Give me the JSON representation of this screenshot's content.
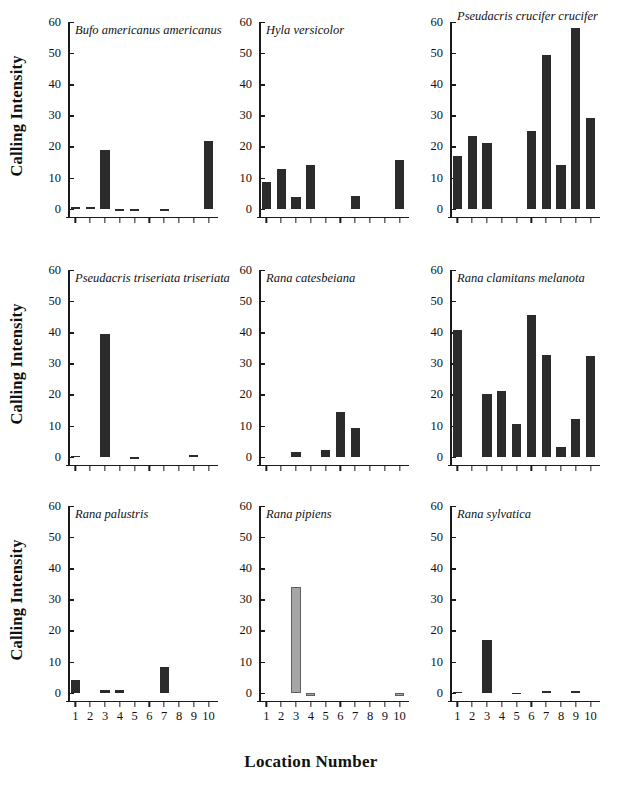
{
  "axes": {
    "ylabel": "Calling Intensity",
    "xlabel": "Location Number",
    "yticks": [
      0,
      10,
      20,
      30,
      40,
      50,
      60
    ],
    "ylim": [
      -3,
      60
    ],
    "xticks": [
      1,
      2,
      3,
      4,
      5,
      6,
      7,
      8,
      9,
      10
    ]
  },
  "colors": {
    "bar_dark": "#2b2b2b",
    "bar_light": "#a6a6a6",
    "axis": "#1a1a1a",
    "background": "#ffffff"
  },
  "chart_data": {
    "type": "bar",
    "title": "",
    "xlabel": "Location Number",
    "ylabel": "Calling Intensity",
    "ylim": [
      -3,
      60
    ],
    "yticks": [
      0,
      10,
      20,
      30,
      40,
      50,
      60
    ],
    "grid": false,
    "legend": "none",
    "categories": [
      1,
      2,
      3,
      4,
      5,
      6,
      7,
      8,
      9,
      10
    ],
    "panel_layout": {
      "rows": 3,
      "cols": 3
    },
    "panels": [
      {
        "label": "Bufo americanus americanus",
        "row": 0,
        "col": 0,
        "color": "#2b2b2b",
        "values": [
          0.6,
          0.6,
          19.0,
          -0.6,
          -0.6,
          0,
          -0.6,
          0,
          0,
          21.8
        ]
      },
      {
        "label": "Hyla versicolor",
        "row": 0,
        "col": 1,
        "color": "#2b2b2b",
        "values": [
          8.5,
          12.8,
          3.7,
          14.0,
          0,
          0,
          4.2,
          0,
          0,
          15.7
        ]
      },
      {
        "label": "Pseudacris crucifer crucifer",
        "row": 0,
        "col": 2,
        "color": "#2b2b2b",
        "values": [
          17.0,
          23.4,
          21.0,
          0,
          0,
          25.0,
          49.5,
          14.0,
          58.0,
          29.0
        ]
      },
      {
        "label": "Pseudacris triseriata triseriata",
        "row": 1,
        "col": 0,
        "color": "#2b2b2b",
        "values": [
          0.3,
          0,
          39.5,
          0,
          -0.7,
          0,
          0,
          0,
          0.4,
          0
        ]
      },
      {
        "label": "Rana catesbeiana",
        "row": 1,
        "col": 1,
        "color": "#2b2b2b",
        "values": [
          0,
          0,
          1.6,
          0,
          2.3,
          14.3,
          9.3,
          0,
          0,
          0
        ]
      },
      {
        "label": "Rana clamitans melanota",
        "row": 1,
        "col": 2,
        "color": "#2b2b2b",
        "values": [
          40.7,
          0,
          20.0,
          21.0,
          10.4,
          45.5,
          32.7,
          3.0,
          12.2,
          32.4
        ]
      },
      {
        "label": "Rana palustris",
        "row": 2,
        "col": 0,
        "color": "#2b2b2b",
        "values": [
          4.0,
          0,
          0.8,
          1.0,
          0,
          0,
          8.3,
          0,
          0,
          0
        ]
      },
      {
        "label": "Rana pipiens",
        "row": 2,
        "col": 1,
        "color": "#a6a6a6",
        "values": [
          0,
          0,
          33.9,
          -1.0,
          0,
          0,
          0,
          0,
          0,
          -1.2
        ]
      },
      {
        "label": "Rana sylvatica",
        "row": 2,
        "col": 2,
        "color": "#2b2b2b",
        "values": [
          0.3,
          0,
          16.8,
          0,
          -0.4,
          0,
          0.6,
          0,
          0.6,
          0
        ]
      }
    ]
  }
}
